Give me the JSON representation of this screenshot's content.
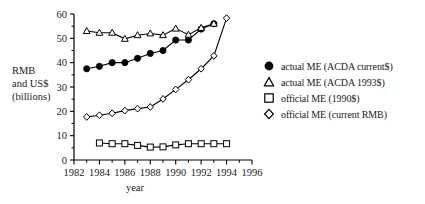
{
  "chart_data": {
    "type": "line",
    "title": "",
    "xlabel": "year",
    "ylabel": "RMB and US$ (billions)",
    "ylabel_lines": [
      "RMB",
      "and US$",
      "(billions)"
    ],
    "xlim": [
      1982,
      1996
    ],
    "ylim": [
      0,
      60
    ],
    "xticks": [
      1982,
      1984,
      1986,
      1988,
      1990,
      1992,
      1994,
      1996
    ],
    "xtick_labels": [
      "1982",
      "1984",
      "1986",
      "1988",
      "1990",
      "1992",
      "1994",
      "1996"
    ],
    "yticks": [
      0,
      10,
      20,
      30,
      40,
      50,
      60
    ],
    "ytick_labels": [
      "0",
      "10",
      "20",
      "30",
      "40",
      "50",
      "60"
    ],
    "grid": false,
    "legend_position": "right",
    "series": [
      {
        "name": "actual ME (ACDA current$)",
        "marker": "filled-circle",
        "color": "#000000",
        "x": [
          1983,
          1984,
          1985,
          1986,
          1987,
          1988,
          1989,
          1990,
          1991,
          1992,
          1993
        ],
        "values": [
          37.5,
          38.5,
          40.0,
          40.0,
          41.8,
          43.8,
          45.0,
          49.3,
          49.3,
          53.8,
          56.0
        ]
      },
      {
        "name": "actual ME (ACDA 1993$)",
        "marker": "open-triangle",
        "color": "#000000",
        "x": [
          1983,
          1984,
          1985,
          1986,
          1987,
          1988,
          1989,
          1990,
          1991,
          1992,
          1993
        ],
        "values": [
          53.0,
          52.3,
          52.3,
          49.8,
          51.3,
          52.0,
          51.3,
          54.0,
          51.5,
          54.3,
          56.0
        ]
      },
      {
        "name": "official ME (1990$)",
        "marker": "open-square",
        "color": "#000000",
        "x": [
          1984,
          1985,
          1986,
          1987,
          1988,
          1989,
          1990,
          1991,
          1992,
          1993,
          1994
        ],
        "values": [
          7.0,
          6.7,
          6.7,
          6.0,
          5.3,
          5.4,
          6.2,
          6.7,
          6.7,
          6.7,
          6.7
        ]
      },
      {
        "name": "official ME (current RMB)",
        "marker": "open-diamond",
        "color": "#000000",
        "x": [
          1983,
          1984,
          1985,
          1986,
          1987,
          1988,
          1989,
          1990,
          1991,
          1992,
          1993,
          1994
        ],
        "values": [
          17.7,
          18.4,
          19.2,
          20.3,
          21.1,
          21.8,
          25.1,
          29.0,
          33.0,
          37.5,
          42.8,
          58.3
        ]
      }
    ]
  },
  "legend": {
    "items": [
      {
        "label": "actual ME (ACDA current$)",
        "marker": "filled-circle-icon"
      },
      {
        "label": "actual ME (ACDA 1993$)",
        "marker": "open-triangle-icon"
      },
      {
        "label": "official ME (1990$)",
        "marker": "open-square-icon"
      },
      {
        "label": "official ME (current RMB)",
        "marker": "open-diamond-icon"
      }
    ]
  },
  "axes": {
    "y_label_line1": "RMB",
    "y_label_line2": "and US$",
    "y_label_line3": "(billions)",
    "x_label": "year"
  }
}
